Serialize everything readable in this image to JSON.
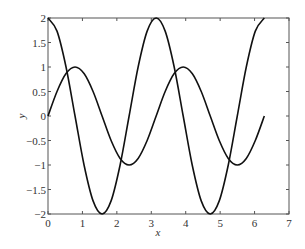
{
  "chart_data": {
    "type": "line",
    "title": "",
    "xlabel": "x",
    "ylabel": "y",
    "xlim": [
      0,
      7
    ],
    "ylim": [
      -2,
      2
    ],
    "xticks": [
      "0",
      "1",
      "2",
      "3",
      "4",
      "5",
      "6",
      "7"
    ],
    "yticks": [
      "-2",
      "-1.5",
      "-1",
      "-0.5",
      "0",
      "0.5",
      "1",
      "1.5",
      "2"
    ],
    "grid": false,
    "legend": null,
    "series": [
      {
        "name": "y = 2cos(2x)",
        "color": "#111111",
        "x": [
          0,
          0.2618,
          0.5236,
          0.7854,
          1.0472,
          1.309,
          1.5708,
          1.8326,
          2.0944,
          2.3562,
          2.618,
          2.8798,
          3.1416,
          3.4034,
          3.6652,
          3.927,
          4.1888,
          4.4506,
          4.7124,
          4.9742,
          5.236,
          5.4978,
          5.7596,
          6.0214,
          6.2832
        ],
        "y": [
          2,
          1.732,
          1,
          0,
          -1,
          -1.732,
          -2,
          -1.732,
          -1,
          0,
          1,
          1.732,
          2,
          1.732,
          1,
          0,
          -1,
          -1.732,
          -2,
          -1.732,
          -1,
          0,
          1,
          1.732,
          2
        ]
      },
      {
        "name": "y = sin(2x)",
        "color": "#111111",
        "x": [
          0,
          0.2618,
          0.5236,
          0.7854,
          1.0472,
          1.309,
          1.5708,
          1.8326,
          2.0944,
          2.3562,
          2.618,
          2.8798,
          3.1416,
          3.4034,
          3.6652,
          3.927,
          4.1888,
          4.4506,
          4.7124,
          4.9742,
          5.236,
          5.4978,
          5.7596,
          6.0214,
          6.2832
        ],
        "y": [
          0,
          0.5,
          0.866,
          1,
          0.866,
          0.5,
          0,
          -0.5,
          -0.866,
          -1,
          -0.866,
          -0.5,
          0,
          0.5,
          0.866,
          1,
          0.866,
          0.5,
          0,
          -0.5,
          -0.866,
          -1,
          -0.866,
          -0.5,
          0
        ]
      }
    ]
  }
}
